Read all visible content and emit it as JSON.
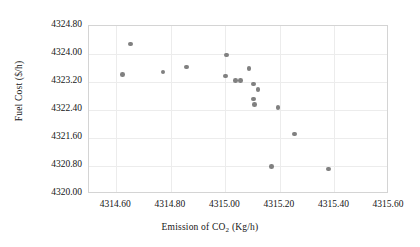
{
  "chart_data": {
    "type": "scatter",
    "title": "",
    "xlabel": "Emission of CO2 (Kg/h)",
    "ylabel": "Fuel Cost ($/h)",
    "xlabel_parts": {
      "pre": "Emission of CO",
      "sub": "2",
      "post": " (Kg/h)"
    },
    "xlim": [
      4314.5,
      4315.6
    ],
    "ylim": [
      4320.0,
      4324.8
    ],
    "xticks": [
      "4314.60",
      "4314.80",
      "4315.00",
      "4315.20",
      "4315.40",
      "4315.60"
    ],
    "xtick_values": [
      4314.6,
      4314.8,
      4315.0,
      4315.2,
      4315.4,
      4315.6
    ],
    "yticks": [
      "4320.00",
      "4320.80",
      "4321.60",
      "4322.40",
      "4323.20",
      "4324.00",
      "4324.80"
    ],
    "ytick_values": [
      4320.0,
      4320.8,
      4321.6,
      4322.4,
      4323.2,
      4324.0,
      4324.8
    ],
    "grid": true,
    "legend": "none",
    "marker": {
      "shape": "circle",
      "color": "#808080",
      "size": 4.6
    },
    "points": [
      {
        "x": 4314.655,
        "y": 4324.26
      },
      {
        "x": 4314.627,
        "y": 4323.38
      },
      {
        "x": 4314.775,
        "y": 4323.46
      },
      {
        "x": 4314.862,
        "y": 4323.6
      },
      {
        "x": 4315.005,
        "y": 4323.34
      },
      {
        "x": 4315.008,
        "y": 4323.94
      },
      {
        "x": 4315.041,
        "y": 4323.22
      },
      {
        "x": 4315.06,
        "y": 4323.21
      },
      {
        "x": 4315.09,
        "y": 4323.55
      },
      {
        "x": 4315.107,
        "y": 4323.11
      },
      {
        "x": 4315.124,
        "y": 4322.96
      },
      {
        "x": 4315.107,
        "y": 4322.68
      },
      {
        "x": 4315.11,
        "y": 4322.53
      },
      {
        "x": 4315.197,
        "y": 4322.45
      },
      {
        "x": 4315.257,
        "y": 4321.68
      },
      {
        "x": 4315.172,
        "y": 4320.76
      },
      {
        "x": 4315.382,
        "y": 4320.68
      }
    ]
  }
}
